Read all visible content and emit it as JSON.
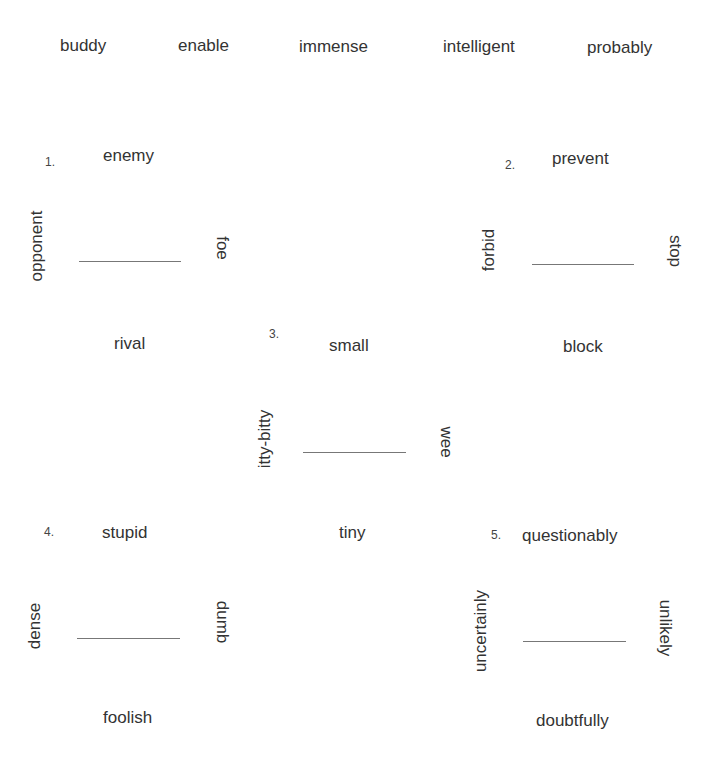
{
  "word_bank": [
    "buddy",
    "enable",
    "immense",
    "intelligent",
    "probably"
  ],
  "puzzles": [
    {
      "number": "1.",
      "top": "enemy",
      "left": "opponent",
      "right": "foe",
      "bottom": "rival",
      "answer": ""
    },
    {
      "number": "2.",
      "top": "prevent",
      "left": "forbid",
      "right": "stop",
      "bottom": "block",
      "answer": ""
    },
    {
      "number": "3.",
      "top": "small",
      "left": "itty-bitty",
      "right": "wee",
      "bottom": "tiny",
      "answer": ""
    },
    {
      "number": "4.",
      "top": "stupid",
      "left": "dense",
      "right": "dumb",
      "bottom": "foolish",
      "answer": ""
    },
    {
      "number": "5.",
      "top": "questionably",
      "left": "uncertainly",
      "right": "unlikely",
      "bottom": "doubtfully",
      "answer": ""
    }
  ]
}
